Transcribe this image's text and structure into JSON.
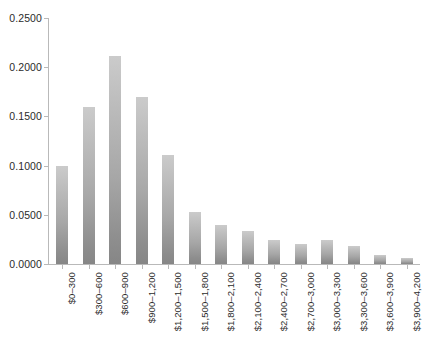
{
  "chart_data": {
    "type": "bar",
    "title": "",
    "subtitle": "",
    "xlabel": "",
    "ylabel": "",
    "grid": false,
    "legend": false,
    "legend_position": "none",
    "ylim": [
      0.0,
      0.25
    ],
    "y_ticks": [
      0.0,
      0.05,
      0.1,
      0.15,
      0.2,
      0.25
    ],
    "y_tick_labels": [
      "0.0000",
      "0.0500",
      "0.1000",
      "0.1500",
      "0.2000",
      "0.2500"
    ],
    "categories": [
      "$0–300",
      "$300–600",
      "$600–900",
      "$900–1,200",
      "$1,200–1,500",
      "$1,500–1,800",
      "$1,800–2,100",
      "$2,100–2,400",
      "$2,400–2,700",
      "$2,700–3,000",
      "$3,000–3,300",
      "$3,300–3,600",
      "$3,600–3,900",
      "$3,900–4,200"
    ],
    "values": [
      0.0996,
      0.1596,
      0.2114,
      0.1697,
      0.1108,
      0.0529,
      0.0396,
      0.0335,
      0.0244,
      0.0203,
      0.0244,
      0.0183,
      0.0091,
      0.0061
    ],
    "bar_color_top": "#cbcbcb",
    "bar_color_bottom": "#868686",
    "axis_color": "#b9b9b9",
    "text_color": "#2b2b2b",
    "background_color": "#ffffff"
  }
}
